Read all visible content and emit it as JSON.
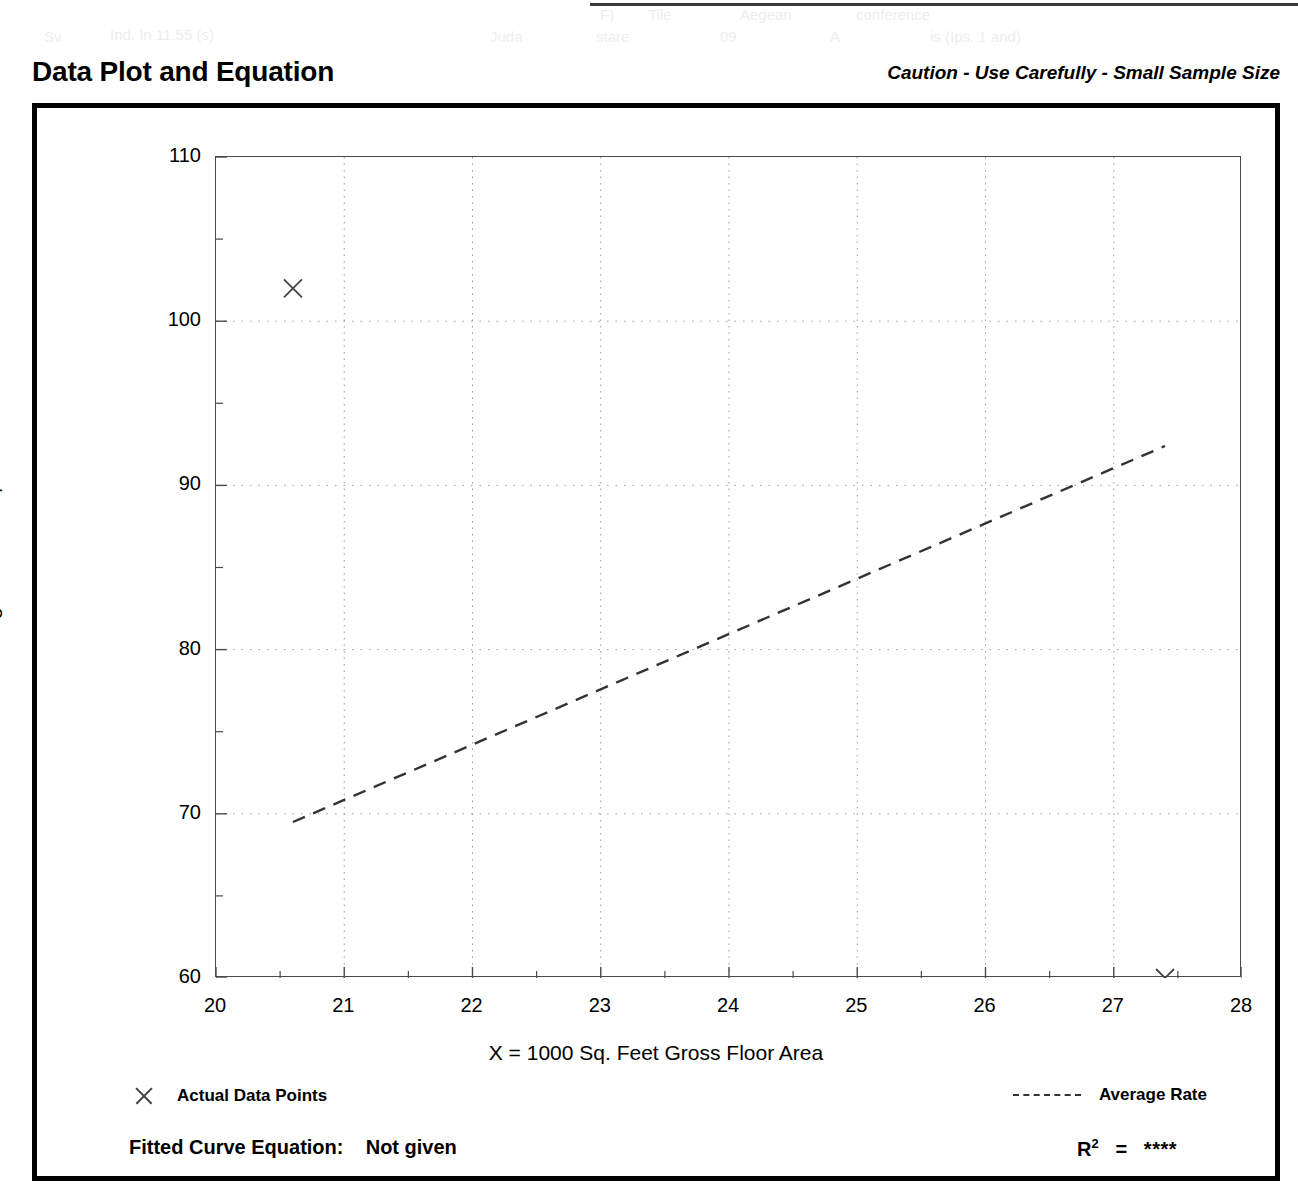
{
  "header": {
    "title": "Data Plot and Equation",
    "caution": "Caution - Use Carefully - Small Sample Size"
  },
  "legend": {
    "data_points_label": "Actual Data Points",
    "average_rate_label": "Average Rate",
    "data_marker_icon": "x-marker-icon",
    "rate_line_icon": "dashed-line-icon"
  },
  "equation": {
    "fitted_curve_label": "Fitted Curve Equation:",
    "fitted_curve_value": "Not given",
    "r_squared_label": "R",
    "r_squared_exponent": "2",
    "r_squared_equals": "=",
    "r_squared_value": "****"
  },
  "colors": {
    "frame": "#000000",
    "axis": "#4a4a4a",
    "grid": "#9a9a9a",
    "marker": "#444444",
    "trend": "#333333"
  },
  "chart_data": {
    "type": "scatter",
    "title": "Data Plot and Equation",
    "subtitle": "Caution - Use Carefully - Small Sample Size",
    "xlabel": "X = 1000 Sq. Feet Gross Floor Area",
    "ylabel": "T = Average Vehicle Trip Ends",
    "xlim": [
      20,
      28
    ],
    "ylim": [
      60,
      110
    ],
    "xticks": [
      20,
      21,
      22,
      23,
      24,
      25,
      26,
      27,
      28
    ],
    "yticks": [
      60,
      70,
      80,
      90,
      100,
      110
    ],
    "x_minor_tick_step": 0.5,
    "y_minor_tick_step": 5,
    "grid": true,
    "grid_style": "dotted",
    "legend_position": "below-plot",
    "series": [
      {
        "name": "Actual Data Points",
        "type": "scatter",
        "marker": "x",
        "points": [
          {
            "x": 20.6,
            "y": 102.0
          },
          {
            "x": 27.4,
            "y": 60.0
          }
        ]
      },
      {
        "name": "Average Rate",
        "type": "line",
        "style": "dashed",
        "points": [
          {
            "x": 20.6,
            "y": 69.5
          },
          {
            "x": 27.4,
            "y": 92.4
          }
        ],
        "note": "Average rate line through origin: T = 3.37 * X approximately"
      }
    ],
    "fitted_curve_equation": "Not given",
    "r_squared": "****"
  },
  "scan_artifacts": [
    {
      "text": "F)",
      "left": 600,
      "top": 6
    },
    {
      "text": "Tile",
      "left": 648,
      "top": 6
    },
    {
      "text": "Aegean",
      "left": 740,
      "top": 6
    },
    {
      "text": "conference",
      "left": 856,
      "top": 6
    },
    {
      "text": "Sv",
      "left": 44,
      "top": 28
    },
    {
      "text": "Ind. In 11.55 (s)",
      "left": 110,
      "top": 26
    },
    {
      "text": "Juda",
      "left": 490,
      "top": 28
    },
    {
      "text": "stare",
      "left": 596,
      "top": 28
    },
    {
      "text": "09",
      "left": 720,
      "top": 28
    },
    {
      "text": "A",
      "left": 830,
      "top": 28
    },
    {
      "text": "is (Ips. 1 and)",
      "left": 930,
      "top": 28
    }
  ]
}
